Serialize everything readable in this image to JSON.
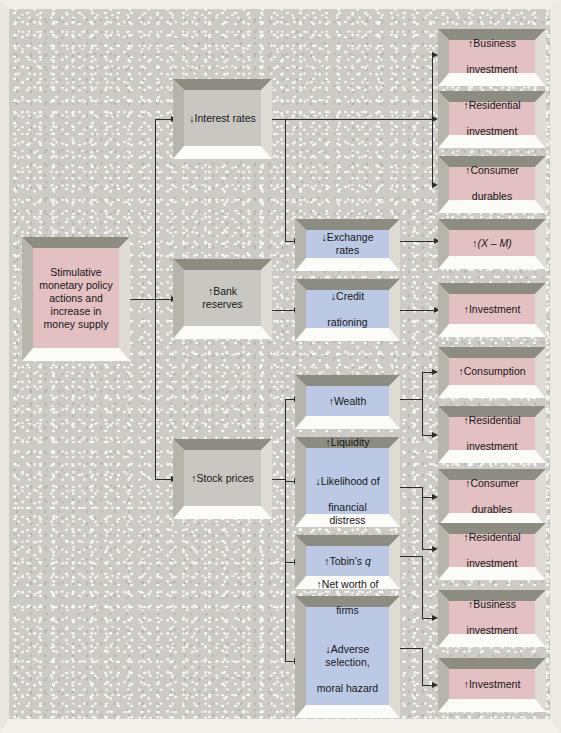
{
  "diagram": {
    "colors": {
      "pink_face": "#e3c0c2",
      "blue_face": "#bcc9e4",
      "grey_face": "#c9c7c1",
      "background": "#cdcbc5",
      "connector": "#2b2b2b",
      "bevel_top": "#8d8c80",
      "bevel_bottom": "#fbfbf8"
    },
    "source": {
      "id": "source",
      "text": "Stimulative\nmonetary policy\nactions and\nincrease in\nmoney supply",
      "lines": [
        "Stimulative",
        "monetary policy",
        "actions and",
        "increase in",
        "money supply"
      ],
      "color": "pink"
    },
    "channels": [
      {
        "id": "interest-rates",
        "label": "↓Interest rates",
        "color": "grey"
      },
      {
        "id": "bank-reserves",
        "label": "↑Bank reserves",
        "color": "grey"
      },
      {
        "id": "stock-prices",
        "label": "↑Stock prices",
        "color": "grey"
      }
    ],
    "intermediates": [
      {
        "id": "exchange-rates",
        "lines": [
          "↓Exchange rates"
        ],
        "color": "blue"
      },
      {
        "id": "credit-rationing",
        "lines": [
          "↓Credit",
          "rationing"
        ],
        "color": "blue"
      },
      {
        "id": "wealth",
        "lines": [
          "↑Wealth"
        ],
        "color": "blue"
      },
      {
        "id": "liquidity",
        "lines": [
          "↑Liquidity",
          "",
          "↓Likelihood of",
          "financial distress"
        ],
        "color": "blue"
      },
      {
        "id": "tobins-q",
        "lines": [
          "↑Tobin’s q"
        ],
        "color": "blue",
        "italic_tail": "q"
      },
      {
        "id": "net-worth",
        "lines": [
          "↑Net worth of",
          "firms",
          "",
          "↓Adverse selection,",
          "moral hazard",
          "",
          "↑Bank loans"
        ],
        "color": "blue"
      }
    ],
    "outcomes": [
      {
        "id": "business-investment-1",
        "lines": [
          "↑Business",
          "investment"
        ],
        "color": "pink"
      },
      {
        "id": "residential-investment-1",
        "lines": [
          "↑Residential",
          "investment"
        ],
        "color": "pink"
      },
      {
        "id": "consumer-durables-1",
        "lines": [
          "↑Consumer",
          "durables"
        ],
        "color": "pink"
      },
      {
        "id": "net-exports",
        "lines": [
          "↑(X – M)"
        ],
        "color": "pink",
        "has_italic": true
      },
      {
        "id": "investment-1",
        "lines": [
          "↑Investment"
        ],
        "color": "pink"
      },
      {
        "id": "consumption",
        "lines": [
          "↑Consumption"
        ],
        "color": "pink"
      },
      {
        "id": "residential-investment-2",
        "lines": [
          "↑Residential",
          "investment"
        ],
        "color": "pink"
      },
      {
        "id": "consumer-durables-2",
        "lines": [
          "↑Consumer",
          "durables"
        ],
        "color": "pink"
      },
      {
        "id": "residential-investment-3",
        "lines": [
          "↑Residential",
          "investment"
        ],
        "color": "pink"
      },
      {
        "id": "business-investment-2",
        "lines": [
          "↑Business",
          "investment"
        ],
        "color": "pink"
      },
      {
        "id": "investment-2",
        "lines": [
          "↑Investment"
        ],
        "color": "pink"
      }
    ],
    "edges": [
      {
        "from": "source",
        "to": "interest-rates"
      },
      {
        "from": "source",
        "to": "bank-reserves"
      },
      {
        "from": "source",
        "to": "stock-prices"
      },
      {
        "from": "interest-rates",
        "to": "business-investment-1"
      },
      {
        "from": "interest-rates",
        "to": "residential-investment-1"
      },
      {
        "from": "interest-rates",
        "to": "consumer-durables-1"
      },
      {
        "from": "interest-rates",
        "to": "exchange-rates"
      },
      {
        "from": "bank-reserves",
        "to": "credit-rationing"
      },
      {
        "from": "exchange-rates",
        "to": "net-exports"
      },
      {
        "from": "credit-rationing",
        "to": "investment-1"
      },
      {
        "from": "stock-prices",
        "to": "wealth"
      },
      {
        "from": "stock-prices",
        "to": "liquidity"
      },
      {
        "from": "stock-prices",
        "to": "tobins-q"
      },
      {
        "from": "stock-prices",
        "to": "net-worth"
      },
      {
        "from": "wealth",
        "to": "consumption"
      },
      {
        "from": "wealth",
        "to": "residential-investment-2"
      },
      {
        "from": "liquidity",
        "to": "consumer-durables-2"
      },
      {
        "from": "liquidity",
        "to": "residential-investment-3"
      },
      {
        "from": "tobins-q",
        "to": "business-investment-2"
      },
      {
        "from": "net-worth",
        "to": "investment-2"
      }
    ]
  }
}
